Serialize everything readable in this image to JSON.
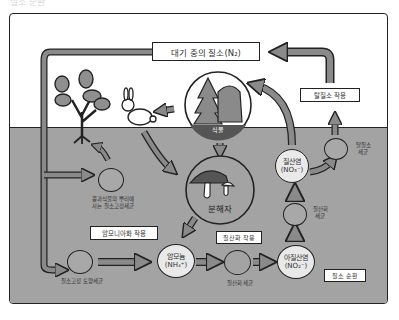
{
  "diagram": {
    "title": "질소 순환",
    "legend_label": "질소 순환",
    "atmosphere_box": "대기 중의 질소(N₂)",
    "processes": {
      "denitrification": "탈질소 작용",
      "ammonification": "암모니아화 작용",
      "nitrification": "질산화 작용"
    },
    "nodes": {
      "plant_label": "식물",
      "decomposer": "분해자",
      "ammonium_name": "암모늄",
      "ammonium_formula": "(NH₄⁺)",
      "nitrate_name": "질산염",
      "nitrate_formula": "(NO₃⁻)",
      "nitrite_name": "아질산염",
      "nitrite_formula": "(NO₂⁻)"
    },
    "bacteria": {
      "legume_line1": "콩과식물의 뿌리에",
      "legume_line2": "사는 질소고정세균",
      "soil_fixing": "질소고정 토양세균",
      "nitrifying": "질산화 세균",
      "nitrite_line1": "질산화",
      "nitrite_line2": "세균",
      "denitrifying_line1": "탈질소",
      "denitrifying_line2": "세균"
    },
    "colors": {
      "ground": "#a3a3a3",
      "arrow_fill": "#8a8a8a",
      "outline": "#222222",
      "sky": "#ffffff"
    }
  }
}
